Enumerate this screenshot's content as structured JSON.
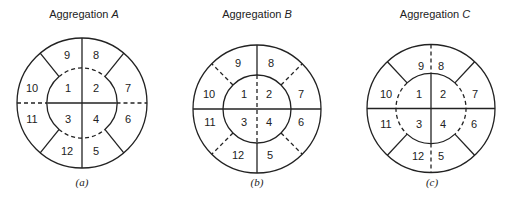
{
  "figure": {
    "panels": [
      {
        "title_prefix": "Aggregation ",
        "title_letter": "A",
        "caption": "(a)",
        "regions": [
          "1",
          "2",
          "3",
          "4",
          "5",
          "6",
          "7",
          "8",
          "9",
          "10",
          "11",
          "12"
        ],
        "line_styles": {
          "outer_circle": "solid",
          "inner_circle_top_bottom_arcs": "dashed",
          "inner_circle_left_right_arcs": "solid",
          "vertical_inner": "solid",
          "vertical_outer_ring": "solid",
          "horizontal_inner": "solid",
          "horizontal_outer_ring": "dashed",
          "diagonals_outer_ring": "solid"
        }
      },
      {
        "title_prefix": "Aggregation ",
        "title_letter": "B",
        "caption": "(b)",
        "regions": [
          "1",
          "2",
          "3",
          "4",
          "5",
          "6",
          "7",
          "8",
          "9",
          "10",
          "11",
          "12"
        ],
        "line_styles": {
          "outer_circle": "solid",
          "inner_circle": "solid",
          "vertical_inner": "dashed",
          "vertical_outer_ring": "solid",
          "horizontal_inner": "solid",
          "horizontal_outer_ring": "solid",
          "diagonals_outer_ring": "dashed"
        }
      },
      {
        "title_prefix": "Aggregation ",
        "title_letter": "C",
        "caption": "(c)",
        "regions": [
          "1",
          "2",
          "3",
          "4",
          "5",
          "6",
          "7",
          "8",
          "9",
          "10",
          "11",
          "12"
        ],
        "line_styles": {
          "outer_circle": "solid",
          "inner_circle_top_bottom_arcs": "solid",
          "inner_circle_left_right_arcs": "dashed",
          "vertical_inner": "solid",
          "vertical_outer_ring": "dashed",
          "horizontal_inner": "solid",
          "horizontal_outer_ring": "solid",
          "diagonals_outer_ring": "solid"
        }
      }
    ]
  }
}
